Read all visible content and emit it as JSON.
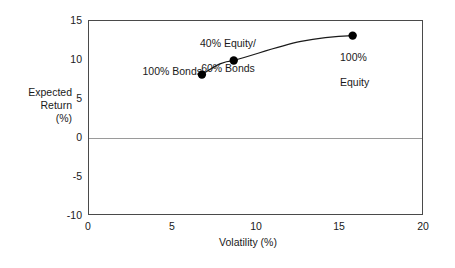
{
  "chart_data": {
    "type": "line",
    "title": "",
    "xlabel": "Volatility (%)",
    "ylabel": "Expected\nReturn\n(%)",
    "ylabel_lines": [
      "Expected",
      "Return",
      "(%)"
    ],
    "xlim": [
      0,
      20
    ],
    "ylim": [
      -10,
      15
    ],
    "xticks": [
      0,
      5,
      10,
      15,
      20
    ],
    "yticks": [
      15,
      10,
      5,
      0,
      -5,
      -10
    ],
    "xtick_labels": [
      "0",
      "5",
      "10",
      "15",
      "20"
    ],
    "ytick_labels": [
      "15",
      "10",
      "5",
      "0",
      "-5",
      "-10"
    ],
    "grid": false,
    "legend": "none",
    "zero_reference_line": 0,
    "series": [
      {
        "name": "Efficient frontier",
        "x": [
          6.8,
          8.7,
          15.8
        ],
        "y": [
          8.0,
          9.8,
          13.0
        ],
        "labels": [
          "100% Bonds",
          "40% Equity/\n60% Bonds",
          "100% Equity"
        ],
        "marker_color": "#000000",
        "line_color": "#1a1a1a"
      }
    ],
    "annotations": [
      {
        "text": "100% Bonds",
        "x": 6.8,
        "y": 8.0
      },
      {
        "text": "40% Equity/\n60% Bonds",
        "x": 8.7,
        "y": 9.8
      },
      {
        "text": "100% Equity",
        "x": 15.8,
        "y": 13.0
      }
    ]
  },
  "axes": {
    "x_title": "Volatility (%)",
    "y_title_line1": "Expected",
    "y_title_line2": "Return",
    "y_title_line3": "(%)",
    "x_ticks": [
      "0",
      "5",
      "10",
      "15",
      "20"
    ],
    "y_ticks": [
      "15",
      "10",
      "5",
      "0",
      "-5",
      "-10"
    ]
  },
  "annotations": {
    "bonds": "100% Bonds",
    "mixed_line1": "40% Equity/",
    "mixed_line2": "60% Bonds",
    "equity_line1": "100%",
    "equity_line2": "Equity"
  },
  "colors": {
    "frame": "#4a4a4a",
    "zero_line": "#9a9a9a",
    "marker": "#000000",
    "curve": "#1a1a1a",
    "text": "#1a1a1a",
    "background": "#ffffff"
  }
}
